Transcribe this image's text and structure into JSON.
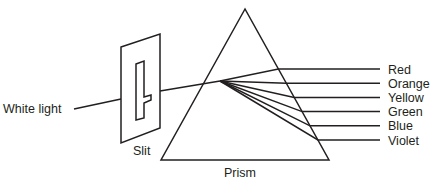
{
  "diagram": {
    "labels": {
      "input": "White light",
      "slit": "Slit",
      "prism": "Prism"
    },
    "spectrum": [
      {
        "name": "Red"
      },
      {
        "name": "Orange"
      },
      {
        "name": "Yellow"
      },
      {
        "name": "Green"
      },
      {
        "name": "Blue"
      },
      {
        "name": "Violet"
      }
    ],
    "stroke_color": "#231f20"
  }
}
